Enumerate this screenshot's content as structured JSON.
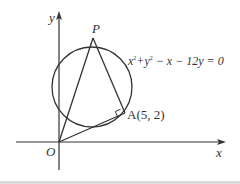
{
  "figure": {
    "type": "coordinate-geometry",
    "axes": {
      "x_label": "x",
      "y_label": "y",
      "origin_label": "O"
    },
    "circle": {
      "equation_parts": [
        "x",
        "2",
        "+y",
        "2",
        " − x − 12y = 0"
      ],
      "equation_text": "x²+y² − x − 12y = 0"
    },
    "points": {
      "P": {
        "label": "P"
      },
      "A": {
        "label": "A(5, 2)"
      },
      "O": {
        "label": "O"
      }
    },
    "segments": [
      "OP",
      "PA",
      "OA"
    ],
    "right_angle_at": "A",
    "colors": {
      "stroke": "#333333",
      "background": "#ffffff",
      "band": "#dcdcdc"
    }
  }
}
